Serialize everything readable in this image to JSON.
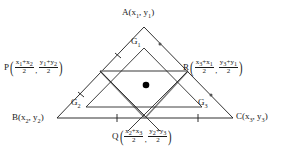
{
  "figure": {
    "type": "geometry-diagram",
    "colors": {
      "outline": "#1a1a1a",
      "medial": "#7a7a7a",
      "centroid_dot": "#000000",
      "background": "#ffffff"
    }
  },
  "vertices": {
    "a": {
      "name": "A",
      "x": "x",
      "x_sub": "1",
      "y": "y",
      "y_sub": "1"
    },
    "b": {
      "name": "B",
      "x": "x",
      "x_sub": "2",
      "y": "y",
      "y_sub": "2"
    },
    "c": {
      "name": "C",
      "x": "x",
      "x_sub": "3",
      "y": "y",
      "y_sub": "3"
    }
  },
  "midpoints": {
    "p": {
      "name": "P",
      "x_num_a": "x",
      "x_num_a_sub": "1",
      "x_num_b": "x",
      "x_num_b_sub": "2",
      "x_den": "2",
      "y_num_a": "y",
      "y_num_a_sub": "1",
      "y_num_b": "y",
      "y_num_b_sub": "2",
      "y_den": "2"
    },
    "q": {
      "name": "Q",
      "x_num_a": "x",
      "x_num_a_sub": "2",
      "x_num_b": "x",
      "x_num_b_sub": "3",
      "x_den": "2",
      "y_num_a": "y",
      "y_num_a_sub": "2",
      "y_num_b": "y",
      "y_num_b_sub": "3",
      "y_den": "2"
    },
    "r": {
      "name": "R",
      "x_num_a": "x",
      "x_num_a_sub": "3",
      "x_num_b": "x",
      "x_num_b_sub": "1",
      "x_den": "2",
      "y_num_a": "y",
      "y_num_a_sub": "3",
      "y_num_b": "y",
      "y_num_b_sub": "1",
      "y_den": "2"
    }
  },
  "centroids": {
    "g1": {
      "name": "G",
      "sub": "1"
    },
    "g2": {
      "name": "G",
      "sub": "2"
    },
    "g3": {
      "name": "G",
      "sub": "3"
    }
  },
  "symbols": {
    "plus": "+",
    "comma": ",",
    "paren_open": "(",
    "paren_close": ")"
  }
}
